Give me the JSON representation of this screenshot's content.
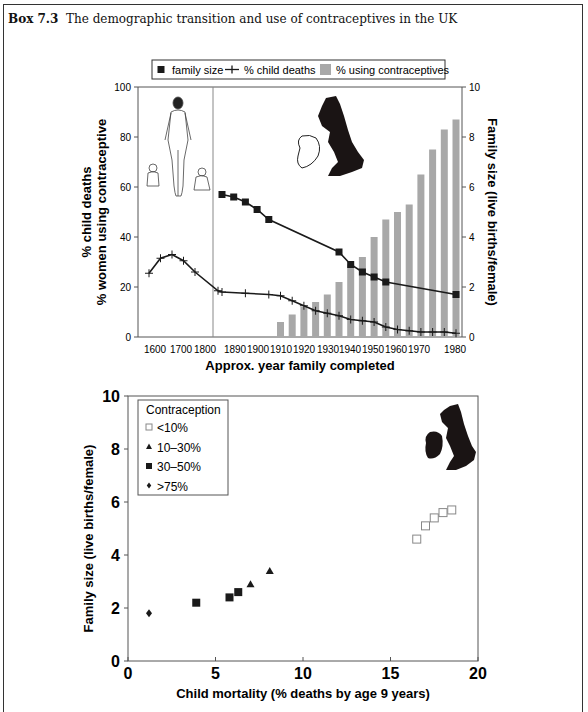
{
  "box": {
    "label": "Box 7.3",
    "title": "The demographic transition and use of contraceptives in the UK"
  },
  "colors": {
    "line": "#1a1a1a",
    "bar": "#a8a8a8",
    "axis": "#555555",
    "separator": "#888888",
    "map": "#1a1414"
  },
  "chart_data": [
    {
      "type": "bar+line",
      "title": "",
      "legend": {
        "position": "top-center",
        "entries": [
          {
            "marker": "filled-square-line",
            "label": "family size"
          },
          {
            "marker": "plus-line",
            "label": "% child deaths"
          },
          {
            "marker": "grey-bar",
            "label": "% using contraceptives"
          }
        ]
      },
      "xlabel": "Approx. year family completed",
      "ylabel_left": [
        "% child deaths",
        "% women using contraceptive"
      ],
      "ylabel_right": "Family size (live births/female)",
      "ylim_left": [
        0,
        100
      ],
      "yticks_left": [
        0,
        20,
        40,
        60,
        80,
        100
      ],
      "ylim_right": [
        0,
        10
      ],
      "yticks_right": [
        0,
        2,
        4,
        6,
        8,
        10
      ],
      "xtick_labels": [
        "1600",
        "1700",
        "1800",
        "1890",
        "1900",
        "1910",
        "1920",
        "1930",
        "1940",
        "1950",
        "1960",
        "1970",
        "1980"
      ],
      "grid": false,
      "note": "Axis is non-linear: 1600-1800 compressed (century scale), separator line, then decade scale 1890-1980",
      "series": [
        {
          "name": "% using contraceptives",
          "kind": "bar",
          "axis": "left",
          "x": [
            1905,
            1910,
            1915,
            1920,
            1925,
            1930,
            1935,
            1940,
            1945,
            1950,
            1955,
            1960,
            1965,
            1970,
            1975,
            1980
          ],
          "values": [
            6,
            9,
            12,
            14,
            17,
            22,
            29,
            32,
            40,
            47,
            50,
            53,
            65,
            75,
            83,
            87
          ]
        },
        {
          "name": "% child deaths",
          "kind": "line",
          "marker": "plus",
          "axis": "left",
          "x": [
            1550,
            1600,
            1650,
            1700,
            1750,
            1850,
            1880,
            1890,
            1900,
            1905,
            1910,
            1915,
            1920,
            1925,
            1930,
            1935,
            1940,
            1945,
            1950,
            1955,
            1960,
            1965,
            1970,
            1975,
            1980
          ],
          "values": [
            25.5,
            31.5,
            33,
            30.5,
            26,
            18.5,
            18,
            17.5,
            17,
            16.5,
            14.5,
            12.5,
            10.5,
            9.5,
            8.5,
            7,
            6.5,
            6,
            4,
            3,
            2.5,
            2,
            2,
            2,
            1.5
          ]
        },
        {
          "name": "family size",
          "kind": "line",
          "marker": "filled-square",
          "axis": "right",
          "x": [
            1880,
            1885,
            1890,
            1895,
            1900,
            1930,
            1935,
            1940,
            1945,
            1950,
            1980
          ],
          "values": [
            5.7,
            5.6,
            5.4,
            5.1,
            4.7,
            3.4,
            2.9,
            2.6,
            2.4,
            2.2,
            1.7
          ]
        }
      ]
    },
    {
      "type": "scatter",
      "title": "",
      "xlabel": "Child mortality (% deaths by age 9 years)",
      "ylabel": "Family size (live births/female)",
      "xlim": [
        0,
        20
      ],
      "xticks": [
        0,
        5,
        10,
        15,
        20
      ],
      "ylim": [
        0,
        10
      ],
      "yticks": [
        0,
        2,
        4,
        6,
        8,
        10
      ],
      "grid": false,
      "legend": {
        "position": "top-left",
        "title": "Contraception",
        "entries": [
          {
            "marker": "open-square",
            "label": "<10%"
          },
          {
            "marker": "filled-triangle",
            "label": "10–30%"
          },
          {
            "marker": "filled-square",
            "label": "30–50%"
          },
          {
            "marker": "filled-diamond",
            "label": ">75%"
          }
        ]
      },
      "series": [
        {
          "name": "<10%",
          "marker": "open-square",
          "x": [
            16.5,
            17.0,
            17.5,
            18.0,
            18.5
          ],
          "y": [
            4.6,
            5.1,
            5.4,
            5.6,
            5.7
          ]
        },
        {
          "name": "10–30%",
          "marker": "filled-triangle",
          "x": [
            7.0,
            8.1
          ],
          "y": [
            2.9,
            3.4
          ]
        },
        {
          "name": "30–50%",
          "marker": "filled-square",
          "x": [
            3.9,
            5.8,
            6.3
          ],
          "y": [
            2.2,
            2.4,
            2.6
          ]
        },
        {
          "name": ">75%",
          "marker": "filled-diamond",
          "x": [
            1.2
          ],
          "y": [
            1.8
          ]
        }
      ]
    }
  ]
}
